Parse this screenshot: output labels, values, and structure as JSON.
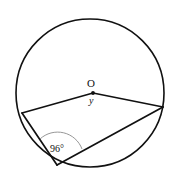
{
  "figure": {
    "kind": "circle-geometry-diagram",
    "background_color": "#ffffff",
    "stroke_color": "#111111",
    "arc_color": "#888888",
    "labels": {
      "center_point": "O",
      "center_angle": "y",
      "inscribed_angle": "96°"
    },
    "geometry": {
      "circle": {
        "center_x": 90,
        "center_y": 93,
        "radius": 74,
        "stroke_width": 1.6
      },
      "center_dot": {
        "x": 93,
        "y": 93,
        "radius": 1.9
      },
      "points": {
        "O": {
          "x": 93,
          "y": 93
        },
        "A_left": {
          "x": 22,
          "y": 113
        },
        "B_right": {
          "x": 163,
          "y": 107
        },
        "C_bottom": {
          "x": 57,
          "y": 165
        }
      },
      "segments": [
        {
          "name": "radius-O-to-A",
          "x1": 93,
          "y1": 93,
          "x2": 22,
          "y2": 113
        },
        {
          "name": "radius-O-to-B",
          "x1": 93,
          "y1": 93,
          "x2": 163,
          "y2": 107
        },
        {
          "name": "chord-A-to-C",
          "x1": 22,
          "y1": 113,
          "x2": 57,
          "y2": 165
        },
        {
          "name": "chord-C-to-B",
          "x1": 57,
          "y1": 165,
          "x2": 163,
          "y2": 107
        }
      ],
      "angle_arc": {
        "name": "inscribed-angle-arc-at-C",
        "path": "M 40 139 A 26 26 0 0 1 82 149",
        "stroke_width": 0.9
      }
    }
  }
}
